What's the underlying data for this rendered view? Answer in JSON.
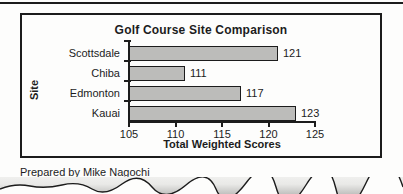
{
  "page": {
    "caption": "Prepared by Mike Nagochi",
    "background": "#fdfdfc"
  },
  "chart_data": {
    "type": "bar",
    "orientation": "horizontal",
    "title": "Golf Course Site Comparison",
    "categories": [
      "Scottsdale",
      "Chiba",
      "Edmonton",
      "Kauai"
    ],
    "values": [
      121,
      111,
      117,
      123
    ],
    "value_labels": [
      "121",
      "111",
      "117",
      "123"
    ],
    "xlabel": "Total Weighted Scores",
    "ylabel": "Site",
    "xlim": [
      105,
      125
    ],
    "xticks": [
      105,
      110,
      115,
      120,
      125
    ],
    "grid": false,
    "legend": "none",
    "bar_fill": "#bcbcba",
    "bar_border": "#1c1c1c",
    "axis_color": "#1c1c1c"
  }
}
